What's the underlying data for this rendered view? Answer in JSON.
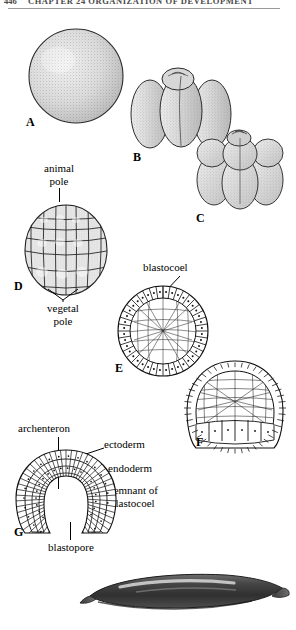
{
  "running_head": {
    "page_number": "446",
    "text": "CHAPTER 24   ORGANIZATION OF DEVELOPMENT"
  },
  "figure": {
    "stage_letters": [
      "A",
      "B",
      "C",
      "D",
      "E",
      "F",
      "G"
    ],
    "stages": [
      {
        "letter": "A",
        "name": "fertilized-egg-zygote",
        "description": "stippled sphere"
      },
      {
        "letter": "B",
        "name": "four-cell-stage",
        "description": "four elongated blastomeres"
      },
      {
        "letter": "C",
        "name": "eight-cell-stage",
        "description": "eight blastomeres, smaller animal tier"
      },
      {
        "letter": "D",
        "name": "morula-late-cleavage",
        "description": "many cells, small at animal pole"
      },
      {
        "letter": "E",
        "name": "blastula-section",
        "description": "hollow ball with blastocoel"
      },
      {
        "letter": "F",
        "name": "early-gastrula-section",
        "description": "invaginating gastrula"
      },
      {
        "letter": "G",
        "name": "late-gastrula-section",
        "description": "archenteron and blastopore"
      },
      {
        "letter": "",
        "name": "larva-photograph",
        "description": "dark elongated swimming larva"
      }
    ],
    "callouts": [
      {
        "id": "animal-pole",
        "text": "animal pole",
        "lines": [
          "animal",
          "pole"
        ],
        "target": "D"
      },
      {
        "id": "vegetal-pole",
        "text": "vegetal pole",
        "lines": [
          "vegetal",
          "pole"
        ],
        "target": "D"
      },
      {
        "id": "blastocoel",
        "text": "blastocoel",
        "lines": [
          "blastocoel"
        ],
        "target": "E"
      },
      {
        "id": "archenteron",
        "text": "archenteron",
        "lines": [
          "archenteron"
        ],
        "target": "G"
      },
      {
        "id": "ectoderm",
        "text": "ectoderm",
        "lines": [
          "ectoderm"
        ],
        "target": "G"
      },
      {
        "id": "endoderm",
        "text": "endoderm",
        "lines": [
          "endoderm"
        ],
        "target": "G"
      },
      {
        "id": "remnant-blastocoel",
        "text": "remnant of blastocoel",
        "lines": [
          "remnant of",
          "blastocoel"
        ],
        "target": "G"
      },
      {
        "id": "blastopore",
        "text": "blastopore",
        "lines": [
          "blastopore"
        ],
        "target": "G"
      }
    ]
  },
  "colors": {
    "ink": "#000000",
    "rule": "#9a9a9a",
    "runhead_text": "#4a4a4a",
    "stipple": "#8d8d8d",
    "cell_fill": "#ffffff",
    "larva_dark": "#3a3a3a",
    "larva_mid": "#5d5d5d"
  }
}
